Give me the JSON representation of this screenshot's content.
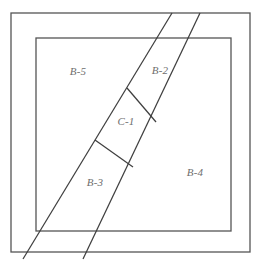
{
  "figure": {
    "type": "parcel-plan-diagram",
    "background_color": "#ffffff",
    "line_color": "#4a4a4a",
    "label_color": "#6e6e6e",
    "width": 261,
    "height": 266
  },
  "frames": {
    "outer": {
      "name": "outer-boundary",
      "x": 11,
      "y": 13,
      "width": 239,
      "height": 239
    },
    "inner": {
      "name": "inner-boundary",
      "x": 36,
      "y": 38,
      "width": 195,
      "height": 193
    }
  },
  "strips": [
    {
      "name": "left-strip-line",
      "x1": 172,
      "y1": 13,
      "x2": 23,
      "y2": 259
    },
    {
      "name": "right-strip-line",
      "x1": 200,
      "y1": 13,
      "x2": 83,
      "y2": 259
    }
  ],
  "cross_lines": [
    {
      "name": "upper-cross-line",
      "x1": 127,
      "y1": 88,
      "x2": 156,
      "y2": 122
    },
    {
      "name": "lower-cross-line",
      "x1": 95,
      "y1": 140,
      "x2": 133,
      "y2": 167
    }
  ],
  "parcels": [
    {
      "id": "b5",
      "label": "B-5",
      "x": 78,
      "y": 72
    },
    {
      "id": "b2",
      "label": "B-2",
      "x": 160,
      "y": 71
    },
    {
      "id": "c1",
      "label": "C-1",
      "x": 126,
      "y": 122
    },
    {
      "id": "b3",
      "label": "B-3",
      "x": 95,
      "y": 183
    },
    {
      "id": "b4",
      "label": "B-4",
      "x": 195,
      "y": 173
    }
  ]
}
